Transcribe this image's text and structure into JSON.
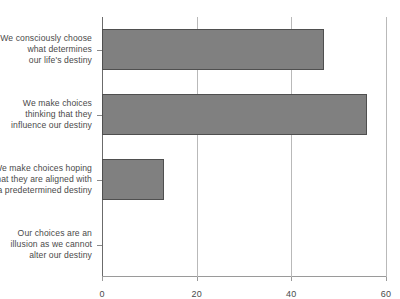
{
  "chart_data": {
    "type": "bar",
    "orientation": "horizontal",
    "title": "",
    "xlabel": "",
    "ylabel": "",
    "xlim": [
      0,
      60
    ],
    "xticks": [
      "0",
      "20",
      "40",
      "60"
    ],
    "xtick_values": [
      0,
      20,
      40,
      60
    ],
    "grid": "vertical",
    "legend": "none",
    "bar_color": "#808080",
    "bar_border_color": "#4f4f4f",
    "categories": [
      "We consciously choose what determines our life's destiny",
      "We make choices thinking that they influence our destiny",
      "We make choices hoping that they are aligned with a predetermined destiny",
      "Our choices are an illusion as we cannot alter our destiny"
    ],
    "category_lines": [
      [
        "We consciously choose",
        "what determines",
        "our life's destiny"
      ],
      [
        "We make choices",
        "thinking that they",
        "influence our destiny"
      ],
      [
        "We make choices hoping",
        "that they are aligned with",
        "a predetermined destiny"
      ],
      [
        "Our choices are an",
        "illusion as we cannot",
        "alter our destiny"
      ]
    ],
    "values": [
      47,
      56,
      13,
      0
    ]
  }
}
